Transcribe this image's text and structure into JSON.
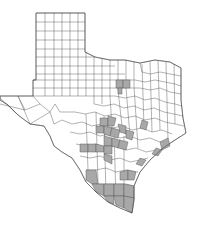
{
  "map": {
    "region": "Texas",
    "subdivision": "counties",
    "colors": {
      "background": "#ffffff",
      "county_fill": "#ffffff",
      "highlight_fill": "#a8a8a8",
      "border": "#555555"
    },
    "legend": null,
    "highlighted_regions": [
      "North Texas cluster (2–3 counties near Dallas–Fort Worth)",
      "Central Texas / Hill Country cluster",
      "Upper Texas coast (near Galveston Bay)",
      "Middle Gulf coast counties",
      "South Texas / Lower Rio Grande Valley cluster"
    ]
  }
}
